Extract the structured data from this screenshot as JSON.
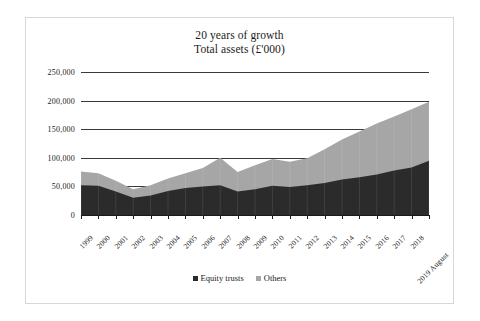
{
  "chart_data": {
    "type": "area",
    "stacked": true,
    "title": "20 years of growth",
    "subtitle": "Total assets (£'000)",
    "xlabel": "",
    "ylabel": "",
    "ylim": [
      0,
      250000
    ],
    "ytick_labels": [
      "250,000",
      "200,000",
      "150,000",
      "100,000",
      "50,000",
      "0"
    ],
    "ytick_values": [
      250000,
      200000,
      150000,
      100000,
      50000,
      0
    ],
    "grid": true,
    "legend_position": "bottom",
    "categories": [
      "1999",
      "2000",
      "2001",
      "2002",
      "2003",
      "2004",
      "2005",
      "2006",
      "2007",
      "2008",
      "2009",
      "2010",
      "2011",
      "2012",
      "2013",
      "2014",
      "2015",
      "2016",
      "2017",
      "2018",
      "2019 August"
    ],
    "series": [
      {
        "name": "Equity trusts",
        "color": "#2b2b2b",
        "values": [
          52000,
          51000,
          41000,
          30000,
          34000,
          42000,
          47000,
          50000,
          52000,
          41000,
          45000,
          51000,
          49000,
          52000,
          56000,
          62000,
          66000,
          71000,
          78000,
          83000,
          95000
        ]
      },
      {
        "name": "Others",
        "color": "#a6a6a6",
        "values": [
          24000,
          22000,
          19000,
          15000,
          18000,
          22000,
          26000,
          32000,
          48000,
          34000,
          42000,
          47000,
          44000,
          47000,
          59000,
          70000,
          80000,
          89000,
          94000,
          102000,
          103000
        ]
      }
    ],
    "totals": [
      76000,
      73000,
      60000,
      45000,
      52000,
      64000,
      73000,
      82000,
      100000,
      75000,
      87000,
      98000,
      93000,
      99000,
      115000,
      132000,
      146000,
      160000,
      172000,
      185000,
      198000
    ]
  },
  "legend": {
    "items": [
      {
        "label": "Equity trusts",
        "color": "#2b2b2b"
      },
      {
        "label": "Others",
        "color": "#a6a6a6"
      }
    ]
  }
}
